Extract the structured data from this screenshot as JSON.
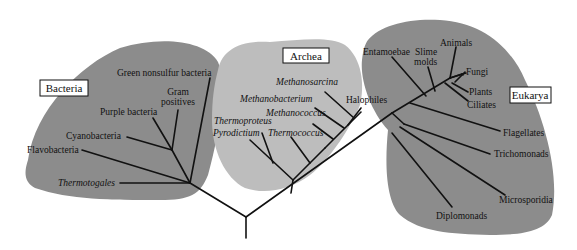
{
  "diagram": {
    "type": "phylogenetic-tree",
    "colors": {
      "background": "#ffffff",
      "bacteria_region": "#8c8c8c",
      "archaea_region": "#bdbdbd",
      "eukarya_region": "#8c8c8c",
      "branches": "#111111"
    },
    "domains": {
      "bacteria": {
        "label": "Bacteria",
        "taxa": [
          {
            "label": "Green nonsulfur bacteria",
            "italic": false
          },
          {
            "label": "Gram",
            "italic": false
          },
          {
            "label": "positives",
            "italic": false
          },
          {
            "label": "Purple bacteria",
            "italic": false
          },
          {
            "label": "Cyanobacteria",
            "italic": false
          },
          {
            "label": "Flavobacteria",
            "italic": false
          },
          {
            "label": "Thermotogales",
            "italic": true
          }
        ]
      },
      "archaea": {
        "label": "Archea",
        "taxa": [
          {
            "label": "Methanosarcina",
            "italic": true
          },
          {
            "label": "Methanobacterium",
            "italic": true
          },
          {
            "label": "Halophiles",
            "italic": false
          },
          {
            "label": "Methanococcus",
            "italic": true
          },
          {
            "label": "Thermoproteus",
            "italic": true
          },
          {
            "label": "Pyrodictium",
            "italic": true
          },
          {
            "label": "Thermococcus",
            "italic": true
          }
        ]
      },
      "eukarya": {
        "label": "Eukarya",
        "taxa": [
          {
            "label": "Entamoebae",
            "italic": false
          },
          {
            "label": "Slime",
            "italic": false
          },
          {
            "label": "molds",
            "italic": false
          },
          {
            "label": "Animals",
            "italic": false
          },
          {
            "label": "Fungi",
            "italic": false
          },
          {
            "label": "Plants",
            "italic": false
          },
          {
            "label": "Ciliates",
            "italic": false
          },
          {
            "label": "Flagellates",
            "italic": false
          },
          {
            "label": "Trichomonads",
            "italic": false
          },
          {
            "label": "Microsporidia",
            "italic": false
          },
          {
            "label": "Diplomonads",
            "italic": false
          }
        ]
      }
    }
  }
}
